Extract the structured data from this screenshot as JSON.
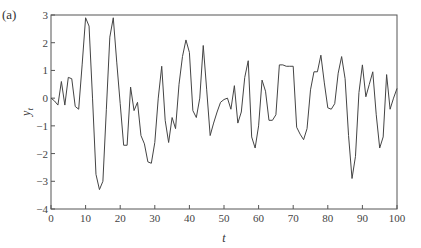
{
  "panel_label": "(a)",
  "chart_data": {
    "type": "line",
    "title": "",
    "panel": "(a)",
    "xlabel": "t",
    "ylabel": "y_t",
    "xlim": [
      0,
      100
    ],
    "ylim": [
      -4,
      3
    ],
    "xticks": [
      0,
      10,
      20,
      30,
      40,
      50,
      60,
      70,
      80,
      90,
      100
    ],
    "yticks": [
      -4,
      -3,
      -2,
      -1,
      0,
      1,
      2,
      3
    ],
    "grid": false,
    "legend": null,
    "line_color": "#444444",
    "series": [
      {
        "name": "y_t",
        "x": [
          0,
          1,
          2,
          3,
          4,
          5,
          6,
          7,
          8,
          9,
          10,
          11,
          12,
          13,
          14,
          15,
          16,
          17,
          18,
          19,
          20,
          21,
          22,
          23,
          24,
          25,
          26,
          27,
          28,
          29,
          30,
          31,
          32,
          33,
          34,
          35,
          36,
          37,
          38,
          39,
          40,
          41,
          42,
          43,
          44,
          45,
          46,
          47,
          48,
          49,
          50,
          51,
          52,
          53,
          54,
          55,
          56,
          57,
          58,
          59,
          60,
          61,
          62,
          63,
          64,
          65,
          66,
          67,
          68,
          69,
          70,
          71,
          72,
          73,
          74,
          75,
          76,
          77,
          78,
          79,
          80,
          81,
          82,
          83,
          84,
          85,
          86,
          87,
          88,
          89,
          90,
          91,
          92,
          93,
          94,
          95,
          96,
          97,
          98,
          99,
          100
        ],
        "values": [
          0.0,
          -0.1,
          -0.25,
          0.6,
          -0.25,
          0.75,
          0.7,
          -0.3,
          -0.4,
          1.2,
          2.9,
          2.6,
          0.0,
          -2.75,
          -3.3,
          -3.0,
          -0.4,
          2.2,
          2.9,
          1.3,
          -0.2,
          -1.7,
          -1.7,
          0.4,
          -0.45,
          -0.15,
          -1.35,
          -1.65,
          -2.3,
          -2.35,
          -1.6,
          0.0,
          1.15,
          -0.8,
          -1.6,
          -0.7,
          -1.1,
          0.5,
          1.5,
          2.1,
          1.65,
          -0.45,
          -0.7,
          0.0,
          1.9,
          0.3,
          -1.35,
          -0.9,
          -0.5,
          -0.15,
          -0.05,
          0.0,
          -0.4,
          0.45,
          -0.9,
          -0.5,
          0.75,
          1.35,
          -1.4,
          -1.8,
          -1.0,
          0.65,
          0.25,
          -0.8,
          -0.8,
          -0.6,
          1.2,
          1.2,
          1.15,
          1.15,
          1.15,
          -1.05,
          -1.3,
          -1.5,
          -1.1,
          0.3,
          0.95,
          0.95,
          1.55,
          0.55,
          -0.35,
          -0.4,
          -0.2,
          0.9,
          1.5,
          0.7,
          -1.35,
          -2.9,
          -2.1,
          0.2,
          1.2,
          0.05,
          0.5,
          0.95,
          -0.6,
          -1.8,
          -1.4,
          0.85,
          -0.4,
          0.0,
          0.35
        ]
      }
    ]
  }
}
